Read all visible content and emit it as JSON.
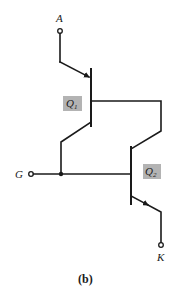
{
  "diagram": {
    "caption": "(b)",
    "terminals": {
      "A": "A",
      "G": "G",
      "K": "K"
    },
    "transistors": [
      {
        "name": "Q",
        "sub": "1",
        "type": "pnp"
      },
      {
        "name": "Q",
        "sub": "2",
        "type": "npn"
      }
    ],
    "colors": {
      "line": "#1a1a1a",
      "label_box": "#b3b3b3",
      "background": "#ffffff"
    }
  }
}
